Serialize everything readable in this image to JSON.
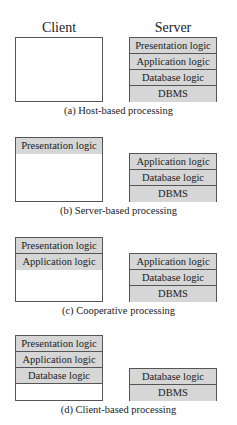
{
  "headers": {
    "client": "Client",
    "server": "Server"
  },
  "panels": [
    {
      "caption": "(a) Host-based processing",
      "client": [],
      "server": [
        "Presentation logic",
        "Application logic",
        "Database logic",
        "DBMS"
      ]
    },
    {
      "caption": "(b) Server-based processing",
      "client": [
        "Presentation logic"
      ],
      "server": [
        "Application logic",
        "Database logic",
        "DBMS"
      ]
    },
    {
      "caption": "(c) Cooperative processing",
      "client": [
        "Presentation logic",
        "Application logic"
      ],
      "server": [
        "Application logic",
        "Database logic",
        "DBMS"
      ]
    },
    {
      "caption": "(d) Client-based processing",
      "client": [
        "Presentation logic",
        "Application logic",
        "Database logic"
      ],
      "server": [
        "Database logic",
        "DBMS"
      ]
    }
  ],
  "colors": {
    "layer_fill": "#d6d6d6",
    "border": "#555555"
  }
}
